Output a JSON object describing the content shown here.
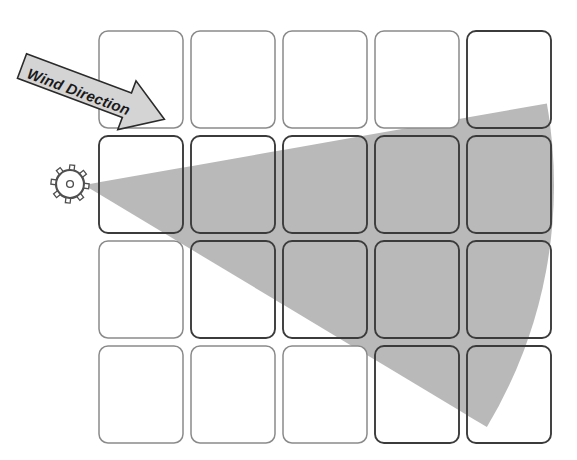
{
  "figure": {
    "background_color": "#ffffff",
    "width": 577,
    "height": 460
  },
  "annotations": {
    "wind_arrow": {
      "label": "Wind Direction",
      "icon": "block-arrow-right-icon",
      "fill_color": "#d4d4d4",
      "stroke_color": "#2b2b2b",
      "rotation_degrees": 20.5,
      "points_toward": "down-right"
    },
    "sensor": {
      "icon": "anemometer-sensor-icon",
      "stroke_color": "#4f4f4f",
      "center_x": 70,
      "center_y": 184,
      "radius": 14,
      "nub_count": 8
    }
  },
  "cone": {
    "name": "dispersion-cone",
    "fill_color": "#b9b9b9",
    "apex_x": 84,
    "apex_y": 185,
    "radius": 470,
    "start_angle_degrees": -10,
    "end_angle_degrees": 31,
    "arc_far_edge": true
  },
  "grid": {
    "name": "plot-grid",
    "rows": 4,
    "columns": 5,
    "cell_width": 84,
    "cell_height": 97,
    "gap_x": 8,
    "gap_y": 8,
    "origin_x": 99,
    "origin_y": 31,
    "corner_radius": 9,
    "cell_fill": "#ffffff",
    "cell_border_color": "#8a8a8a",
    "cell_border_color_affected": "#3b3b3b",
    "cell_border_width": 1.5,
    "cells": [
      {
        "row": 1,
        "col": 1,
        "affected": false
      },
      {
        "row": 1,
        "col": 2,
        "affected": false
      },
      {
        "row": 1,
        "col": 3,
        "affected": false
      },
      {
        "row": 1,
        "col": 4,
        "affected": false
      },
      {
        "row": 1,
        "col": 5,
        "affected": true
      },
      {
        "row": 2,
        "col": 1,
        "affected": true
      },
      {
        "row": 2,
        "col": 2,
        "affected": true
      },
      {
        "row": 2,
        "col": 3,
        "affected": true
      },
      {
        "row": 2,
        "col": 4,
        "affected": true
      },
      {
        "row": 2,
        "col": 5,
        "affected": true
      },
      {
        "row": 3,
        "col": 1,
        "affected": false
      },
      {
        "row": 3,
        "col": 2,
        "affected": true
      },
      {
        "row": 3,
        "col": 3,
        "affected": true
      },
      {
        "row": 3,
        "col": 4,
        "affected": true
      },
      {
        "row": 3,
        "col": 5,
        "affected": true
      },
      {
        "row": 4,
        "col": 1,
        "affected": false
      },
      {
        "row": 4,
        "col": 2,
        "affected": false
      },
      {
        "row": 4,
        "col": 3,
        "affected": false
      },
      {
        "row": 4,
        "col": 4,
        "affected": true
      },
      {
        "row": 4,
        "col": 5,
        "affected": true
      }
    ]
  }
}
